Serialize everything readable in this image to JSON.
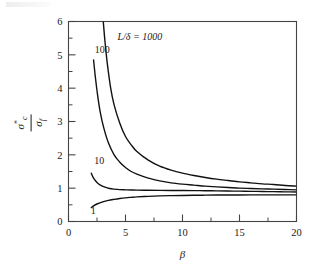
{
  "figure": {
    "background_color": "#ffffff",
    "line_color": "#111111",
    "axis_color": "#444444"
  },
  "ylabel": {
    "numerator_symbol": "σ",
    "numerator_superscript": "*",
    "numerator_subscript": "c",
    "denominator_symbol": "σ",
    "denominator_subscript": "f"
  },
  "chart_data": {
    "type": "line",
    "title": "",
    "subtitle": "",
    "xlabel": "β",
    "ylabel": "σ*c / σf",
    "xlim": [
      0,
      20
    ],
    "ylim": [
      0,
      6
    ],
    "grid": false,
    "legend_position": "inline-curve-labels",
    "x_major_ticks": [
      0,
      5,
      10,
      15,
      20
    ],
    "x_major_tick_labels": [
      "0",
      "5",
      "10",
      "15",
      "20"
    ],
    "x_minor_tick_step": 2.5,
    "y_major_ticks": [
      0,
      1,
      2,
      3,
      4,
      5,
      6
    ],
    "y_major_tick_labels": [
      "0",
      "1",
      "2",
      "3",
      "4",
      "5",
      "6"
    ],
    "y_minor_tick_step": 0.5,
    "annotations": [
      {
        "text": "L/δ  =  1000",
        "x": 4.3,
        "y": 5.45
      },
      {
        "text": "100",
        "x": 2.3,
        "y": 5.05
      },
      {
        "text": "10",
        "x": 2.25,
        "y": 1.72
      },
      {
        "text": "1",
        "x": 1.95,
        "y": 0.22
      }
    ],
    "series": [
      {
        "name": "1000",
        "label": "L/δ = 1000",
        "x": [
          3.05,
          3.2,
          3.4,
          3.7,
          4.0,
          4.5,
          5.0,
          5.5,
          6.0,
          7.0,
          8.0,
          9.0,
          10.0,
          11.0,
          12.0,
          13.0,
          14.0,
          15.0,
          16.0,
          17.0,
          18.0,
          19.0,
          20.0
        ],
        "y": [
          6.0,
          5.4,
          4.75,
          4.0,
          3.5,
          2.95,
          2.55,
          2.3,
          2.1,
          1.84,
          1.66,
          1.54,
          1.45,
          1.38,
          1.32,
          1.27,
          1.23,
          1.19,
          1.16,
          1.13,
          1.11,
          1.08,
          1.06
        ]
      },
      {
        "name": "100",
        "label": "100",
        "x": [
          2.2,
          2.35,
          2.55,
          2.8,
          3.1,
          3.5,
          4.0,
          4.5,
          5.0,
          5.5,
          6.0,
          7.0,
          8.0,
          9.0,
          10.0,
          11.0,
          12.0,
          13.0,
          14.0,
          15.0,
          16.0,
          17.0,
          18.0,
          19.0,
          20.0
        ],
        "y": [
          4.85,
          4.35,
          3.8,
          3.25,
          2.8,
          2.36,
          2.0,
          1.78,
          1.62,
          1.5,
          1.42,
          1.3,
          1.22,
          1.16,
          1.12,
          1.09,
          1.06,
          1.04,
          1.02,
          1.0,
          0.99,
          0.98,
          0.97,
          0.96,
          0.95
        ]
      },
      {
        "name": "10",
        "label": "10",
        "x": [
          2.0,
          2.2,
          2.5,
          2.8,
          3.2,
          3.6,
          4.0,
          4.5,
          5.0,
          5.5,
          6.0,
          7.0,
          8.0,
          9.0,
          10.0,
          11.0,
          12.0,
          13.0,
          14.0,
          15.0,
          16.0,
          17.0,
          18.0,
          19.0,
          20.0
        ],
        "y": [
          1.45,
          1.3,
          1.17,
          1.09,
          1.03,
          0.99,
          0.97,
          0.955,
          0.95,
          0.945,
          0.942,
          0.938,
          0.935,
          0.932,
          0.93,
          0.927,
          0.923,
          0.92,
          0.915,
          0.91,
          0.905,
          0.9,
          0.895,
          0.89,
          0.885
        ]
      },
      {
        "name": "1",
        "label": "1",
        "x": [
          2.0,
          2.2,
          2.5,
          3.0,
          3.5,
          4.0,
          4.5,
          5.0,
          5.5,
          6.0,
          7.0,
          8.0,
          9.0,
          10.0,
          11.0,
          12.0,
          13.0,
          14.0,
          15.0,
          16.0,
          17.0,
          18.0,
          19.0,
          20.0
        ],
        "y": [
          0.42,
          0.47,
          0.525,
          0.59,
          0.635,
          0.665,
          0.69,
          0.71,
          0.725,
          0.738,
          0.755,
          0.768,
          0.776,
          0.782,
          0.787,
          0.79,
          0.793,
          0.795,
          0.797,
          0.798,
          0.799,
          0.8,
          0.8,
          0.8
        ]
      }
    ]
  }
}
